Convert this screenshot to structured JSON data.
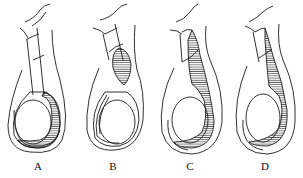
{
  "diagram": {
    "type": "anatomical line drawing",
    "stroke_color": "#1a1a1a",
    "background": "#ffffff",
    "panels": [
      {
        "id": "A",
        "label": "A",
        "hatched_region": "around lower testis only"
      },
      {
        "id": "B",
        "label": "B",
        "hatched_region": "isolated sac in cord above testis"
      },
      {
        "id": "C",
        "label": "C",
        "hatched_region": "continuous from cord down around testis"
      },
      {
        "id": "D",
        "label": "D",
        "hatched_region": "cord and upper scrotal sac, around testis"
      }
    ]
  }
}
